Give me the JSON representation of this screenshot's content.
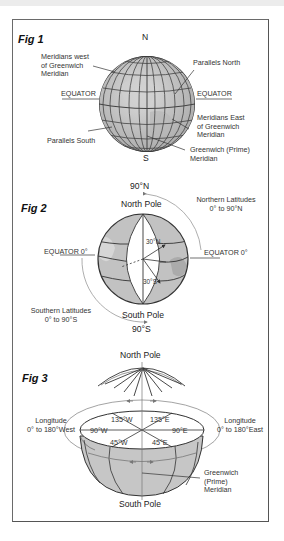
{
  "figures": [
    {
      "id": "fig1",
      "title": "Fig 1",
      "labels": {
        "north": "N",
        "south": "S",
        "meridians_west": [
          "Meridians west",
          "of Greenwich",
          "Meridian"
        ],
        "parallels_north": "Parallels North",
        "equator_left": "EQUATOR",
        "equator_right": "EQUATOR",
        "meridians_east": [
          "Meridians East",
          "of Greenwich",
          "Meridian"
        ],
        "parallels_south": "Parallels South",
        "greenwich": [
          "Greenwich (Prime)",
          "Meridian"
        ]
      }
    },
    {
      "id": "fig2",
      "title": "Fig 2",
      "labels": {
        "top_degree": "90°N",
        "north_pole": "North Pole",
        "northern_latitudes": [
          "Northern Latitudes",
          "0° to 90°N"
        ],
        "equator_left": "EQUATOR 0°",
        "equator_right": "EQUATOR 0°",
        "lat_30n": "30°N",
        "lat_30s": "30°S",
        "southern_latitudes": [
          "Southern Latitudes",
          "0° to 90°S"
        ],
        "south_pole": "South Pole",
        "bottom_degree": "90°S"
      }
    },
    {
      "id": "fig3",
      "title": "Fig 3",
      "labels": {
        "north_pole": "North Pole",
        "longitude_west": [
          "Longitude",
          "0° to 180°West"
        ],
        "longitude_east": [
          "Longitude",
          "0° to 180°East"
        ],
        "lon_135w": "135°W",
        "lon_135e": "135°E",
        "lon_90w": "90°W",
        "lon_90e": "90°E",
        "lon_45w": "45°W",
        "lon_45e": "45°E",
        "greenwich": [
          "Greenwich",
          "(Prime)",
          "Meridian"
        ],
        "south_pole": "South Pole"
      }
    }
  ],
  "colors": {
    "globe_fill": "#c4c4c4",
    "globe_light": "#d9d9d9",
    "line": "#333333",
    "arc": "#9a9a9a"
  }
}
